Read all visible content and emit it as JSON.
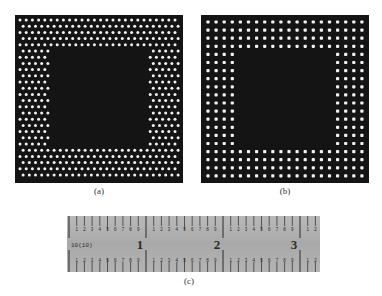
{
  "figure": {
    "panels": [
      {
        "id": "a",
        "caption": "(a)",
        "pattern": "staggered",
        "description": "dense staggered dot array bordering a dark center square"
      },
      {
        "id": "b",
        "caption": "(b)",
        "pattern": "square-grid",
        "description": "regular square-grid dot array bordering a dark center square"
      }
    ],
    "ruler": {
      "caption": "(c)",
      "scale_label": "10(10)",
      "inch_labels": [
        "1",
        "2",
        "3"
      ],
      "sub_labels": [
        "1",
        "2",
        "3",
        "4",
        "5",
        "6",
        "7",
        "8",
        "9"
      ]
    }
  },
  "colors": {
    "panel_background": "#141414",
    "dot": "#f2f2f2",
    "ruler_face": "#b0b0b0",
    "ruler_ink": "#2a2a2a"
  }
}
